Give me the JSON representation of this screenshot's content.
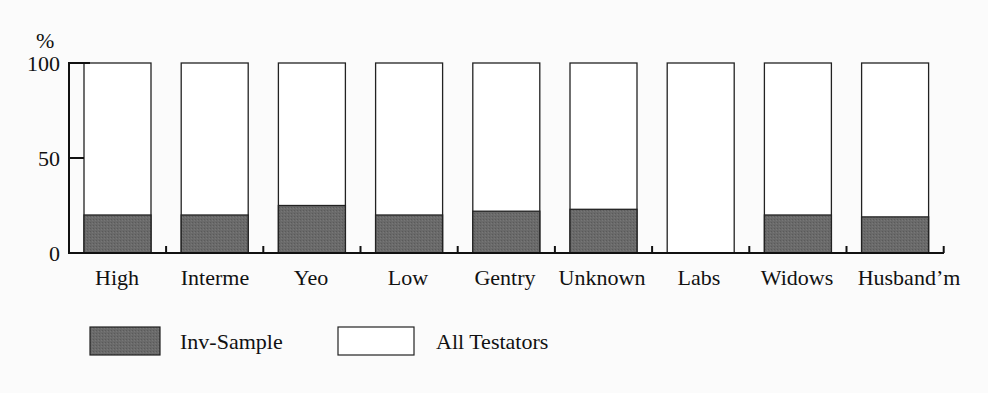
{
  "chart_data": {
    "type": "bar",
    "stacked": true,
    "title": "",
    "xlabel": "",
    "ylabel": "%",
    "ylim": [
      0,
      100
    ],
    "yticks": [
      0,
      50,
      100
    ],
    "categories": [
      "High",
      "Interme",
      "Yeo",
      "Low",
      "Gentry",
      "Unknown",
      "Labs",
      "Widows",
      "Husband'm"
    ],
    "series": [
      {
        "name": "Inv-Sample",
        "color": "#666666",
        "values": [
          20,
          20,
          25,
          20,
          22,
          23,
          0,
          20,
          19
        ]
      },
      {
        "name": "All Testators",
        "color": "#ffffff",
        "values": [
          100,
          100,
          100,
          100,
          100,
          100,
          100,
          100,
          100
        ]
      }
    ],
    "legend": {
      "position": "bottom-left",
      "entries": [
        "Inv-Sample",
        "All Testators"
      ]
    },
    "grid": false
  },
  "labels": {
    "y_unit": "%",
    "y_ticks": [
      "0",
      "50",
      "100"
    ],
    "x": [
      "High",
      "Interme",
      "Yeo",
      "Low",
      "Gentry",
      "Unknown",
      "Labs",
      "Widows",
      "Husband’m"
    ],
    "legend_dark": "Inv-Sample",
    "legend_light": "All Testators"
  }
}
